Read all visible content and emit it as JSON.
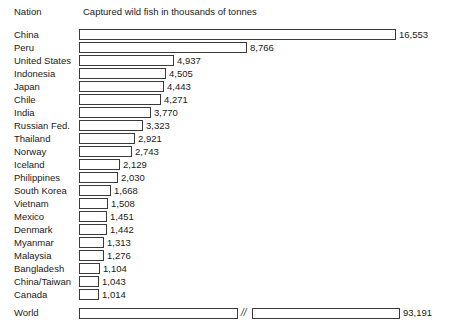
{
  "header": {
    "nation_label": "Nation",
    "title": "Captured wild fish in thousands of tonnes"
  },
  "chart_data": {
    "type": "bar",
    "title": "Captured wild fish in thousands of tonnes",
    "xlabel": "thousands of tonnes",
    "ylabel": "Nation",
    "orientation": "horizontal",
    "grid": false,
    "legend": null,
    "axis_break": {
      "present": true,
      "symbol": "//",
      "applies_to": "World",
      "note": "World bar is drawn with a broken axis because its value greatly exceeds the other bars"
    },
    "categories": [
      "China",
      "Peru",
      "United States",
      "Indonesia",
      "Japan",
      "Chile",
      "India",
      "Russian Fed.",
      "Thailand",
      "Norway",
      "Iceland",
      "Philippines",
      "South Korea",
      "Vietnam",
      "Mexico",
      "Denmark",
      "Myanmar",
      "Malaysia",
      "Bangladesh",
      "China/Taiwan",
      "Canada",
      "World"
    ],
    "values": [
      16553,
      8766,
      4937,
      4505,
      4443,
      4271,
      3770,
      3323,
      2921,
      2743,
      2129,
      2030,
      1668,
      1508,
      1451,
      1442,
      1313,
      1276,
      1104,
      1043,
      1014,
      93191
    ],
    "value_labels": [
      "16,553",
      "8,766",
      "4,937",
      "4,505",
      "4,443",
      "4,271",
      "3,770",
      "3,323",
      "2,921",
      "2,743",
      "2,129",
      "2,030",
      "1,668",
      "1,508",
      "1,451",
      "1,442",
      "1,313",
      "1,276",
      "1,104",
      "1,043",
      "1,014",
      "93,191"
    ],
    "xlim": [
      0,
      16553
    ]
  },
  "rows": [
    {
      "nation": "China",
      "value_label": "16,553",
      "bar_width": 317,
      "label_x": 399
    },
    {
      "nation": "Peru",
      "value_label": "8,766",
      "bar_width": 168,
      "label_x": 250
    },
    {
      "nation": "United States",
      "value_label": "4,937",
      "bar_width": 95,
      "label_x": 177
    },
    {
      "nation": "Indonesia",
      "value_label": "4,505",
      "bar_width": 87,
      "label_x": 169
    },
    {
      "nation": "Japan",
      "value_label": "4,443",
      "bar_width": 85,
      "label_x": 167
    },
    {
      "nation": "Chile",
      "value_label": "4,271",
      "bar_width": 82,
      "label_x": 164
    },
    {
      "nation": "India",
      "value_label": "3,770",
      "bar_width": 72,
      "label_x": 154
    },
    {
      "nation": "Russian Fed.",
      "value_label": "3,323",
      "bar_width": 64,
      "label_x": 146
    },
    {
      "nation": "Thailand",
      "value_label": "2,921",
      "bar_width": 56,
      "label_x": 138
    },
    {
      "nation": "Norway",
      "value_label": "2,743",
      "bar_width": 53,
      "label_x": 135
    },
    {
      "nation": "Iceland",
      "value_label": "2,129",
      "bar_width": 41,
      "label_x": 123
    },
    {
      "nation": "Philippines",
      "value_label": "2,030",
      "bar_width": 39,
      "label_x": 121
    },
    {
      "nation": "South Korea",
      "value_label": "1,668",
      "bar_width": 32,
      "label_x": 114
    },
    {
      "nation": "Vietnam",
      "value_label": "1,508",
      "bar_width": 29,
      "label_x": 111
    },
    {
      "nation": "Mexico",
      "value_label": "1,451",
      "bar_width": 28,
      "label_x": 110
    },
    {
      "nation": "Denmark",
      "value_label": "1,442",
      "bar_width": 28,
      "label_x": 110
    },
    {
      "nation": "Myanmar",
      "value_label": "1,313",
      "bar_width": 25,
      "label_x": 107
    },
    {
      "nation": "Malaysia",
      "value_label": "1,276",
      "bar_width": 25,
      "label_x": 107
    },
    {
      "nation": "Bangladesh",
      "value_label": "1,104",
      "bar_width": 21,
      "label_x": 103
    },
    {
      "nation": "China/Taiwan",
      "value_label": "1,043",
      "bar_width": 20,
      "label_x": 102
    },
    {
      "nation": "Canada",
      "value_label": "1,014",
      "bar_width": 20,
      "label_x": 102
    }
  ],
  "world_row": {
    "nation": "World",
    "value_label": "93,191",
    "break_symbol": "//"
  }
}
